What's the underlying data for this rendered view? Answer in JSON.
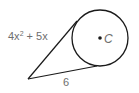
{
  "diagram": {
    "circle": {
      "cx": 100,
      "cy": 38,
      "r": 28,
      "center_label": "C"
    },
    "external_point": {
      "x": 28,
      "y": 79
    },
    "tangent_upper": {
      "x": 77,
      "y": 21,
      "label": "4x² + 5x"
    },
    "tangent_lower": {
      "x": 97,
      "y": 66,
      "label": "6"
    },
    "label_upper_parts": {
      "coef": "4x",
      "exp": "2",
      "rest": " + 5x"
    },
    "stroke_color": "#1a1a1a",
    "label_color": "#6e6e6e"
  }
}
